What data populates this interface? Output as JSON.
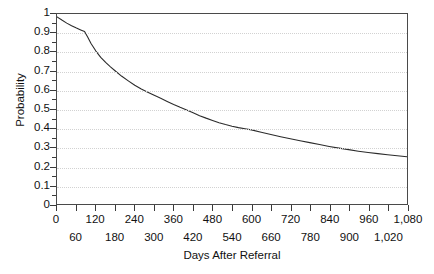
{
  "chart_data": {
    "type": "line",
    "title": "",
    "xlabel": "Days After Referral",
    "ylabel": "Probability",
    "xlim": [
      0,
      1080
    ],
    "ylim": [
      0,
      1
    ],
    "grid": true,
    "legend": null,
    "y_ticks": [
      {
        "value": 1,
        "label": "1"
      },
      {
        "value": 0.9,
        "label": "0.9"
      },
      {
        "value": 0.8,
        "label": "0.8"
      },
      {
        "value": 0.7,
        "label": "0.7"
      },
      {
        "value": 0.6,
        "label": "0.6"
      },
      {
        "value": 0.5,
        "label": "0.5"
      },
      {
        "value": 0.4,
        "label": "0.4"
      },
      {
        "value": 0.3,
        "label": "0.3"
      },
      {
        "value": 0.2,
        "label": "0.2"
      },
      {
        "value": 0.1,
        "label": "0.1"
      },
      {
        "value": 0,
        "label": "0"
      }
    ],
    "x_ticks_top": [
      {
        "value": 0,
        "label": "0"
      },
      {
        "value": 120,
        "label": "120"
      },
      {
        "value": 240,
        "label": "240"
      },
      {
        "value": 360,
        "label": "360"
      },
      {
        "value": 480,
        "label": "480"
      },
      {
        "value": 600,
        "label": "600"
      },
      {
        "value": 720,
        "label": "720"
      },
      {
        "value": 840,
        "label": "840"
      },
      {
        "value": 960,
        "label": "960"
      },
      {
        "value": 1080,
        "label": "1,080"
      }
    ],
    "x_ticks_bottom": [
      {
        "value": 60,
        "label": "60"
      },
      {
        "value": 180,
        "label": "180"
      },
      {
        "value": 300,
        "label": "300"
      },
      {
        "value": 420,
        "label": "420"
      },
      {
        "value": 540,
        "label": "540"
      },
      {
        "value": 660,
        "label": "660"
      },
      {
        "value": 780,
        "label": "780"
      },
      {
        "value": 900,
        "label": "900"
      },
      {
        "value": 1020,
        "label": "1,020"
      }
    ],
    "series": [
      {
        "name": "survival",
        "color": "#2b2b2b",
        "x": [
          0,
          15,
          30,
          45,
          60,
          75,
          85,
          95,
          105,
          120,
          135,
          150,
          165,
          180,
          200,
          220,
          240,
          260,
          280,
          300,
          320,
          340,
          360,
          380,
          400,
          420,
          440,
          460,
          480,
          500,
          520,
          540,
          560,
          580,
          600,
          630,
          660,
          690,
          720,
          750,
          780,
          810,
          840,
          870,
          900,
          930,
          960,
          990,
          1020,
          1050,
          1080
        ],
        "y": [
          0.985,
          0.968,
          0.952,
          0.938,
          0.926,
          0.915,
          0.908,
          0.878,
          0.845,
          0.805,
          0.772,
          0.745,
          0.722,
          0.7,
          0.672,
          0.648,
          0.625,
          0.605,
          0.588,
          0.572,
          0.556,
          0.54,
          0.524,
          0.509,
          0.495,
          0.48,
          0.465,
          0.452,
          0.44,
          0.428,
          0.418,
          0.409,
          0.402,
          0.396,
          0.39,
          0.378,
          0.366,
          0.354,
          0.343,
          0.333,
          0.323,
          0.313,
          0.303,
          0.294,
          0.286,
          0.278,
          0.271,
          0.265,
          0.259,
          0.254,
          0.249
        ]
      }
    ]
  },
  "axes": {
    "y_title": "Probability",
    "x_title": "Days After Referral"
  },
  "colors": {
    "curve": "#2b2b2b",
    "frame": "#4a4a4a",
    "grid": "#d2d2d2",
    "background": "#ffffff"
  }
}
